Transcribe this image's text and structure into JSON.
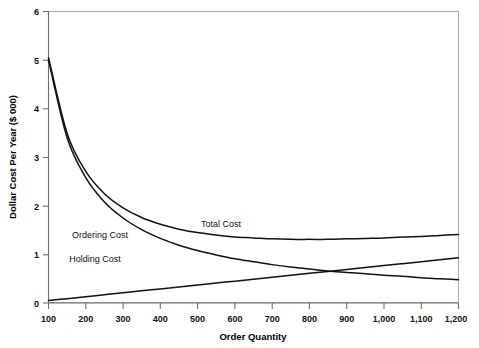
{
  "chart_data": {
    "type": "line",
    "title": "",
    "xlabel": "Order Quantity",
    "ylabel": "Dollar Cost Per Year ($ 000)",
    "xlim": [
      100,
      1200
    ],
    "ylim": [
      0,
      6
    ],
    "grid": false,
    "legend_position": "inline-annotations",
    "x_ticks": [
      100,
      200,
      300,
      400,
      500,
      600,
      700,
      800,
      900,
      1000,
      1100,
      1200
    ],
    "x_tick_labels": [
      "100",
      "200",
      "300",
      "400",
      "500",
      "600",
      "700",
      "800",
      "900",
      "1,000",
      "1,100",
      "1,200"
    ],
    "y_ticks": [
      0,
      1,
      2,
      3,
      4,
      5,
      6
    ],
    "y_tick_labels": [
      "0",
      "1",
      "2",
      "3",
      "4",
      "5",
      "6"
    ],
    "x": [
      100,
      150,
      200,
      250,
      300,
      350,
      400,
      450,
      500,
      550,
      600,
      650,
      700,
      750,
      800,
      850,
      900,
      950,
      1000,
      1050,
      1100,
      1150,
      1200
    ],
    "series": [
      {
        "name": "Ordering Cost",
        "label": "Ordering Cost",
        "color": "#111111",
        "values": [
          5.0,
          3.4,
          2.58,
          2.08,
          1.75,
          1.51,
          1.33,
          1.19,
          1.08,
          0.99,
          0.91,
          0.85,
          0.79,
          0.74,
          0.7,
          0.66,
          0.63,
          0.6,
          0.57,
          0.55,
          0.52,
          0.5,
          0.48
        ]
      },
      {
        "name": "Holding Cost",
        "label": "Holding Cost",
        "color": "#111111",
        "values": [
          0.05,
          0.09,
          0.13,
          0.17,
          0.21,
          0.25,
          0.29,
          0.33,
          0.37,
          0.41,
          0.45,
          0.49,
          0.53,
          0.57,
          0.61,
          0.65,
          0.69,
          0.73,
          0.77,
          0.81,
          0.85,
          0.89,
          0.93
        ]
      },
      {
        "name": "Total Cost",
        "label": "Total Cost",
        "color": "#111111",
        "values": [
          5.05,
          3.49,
          2.71,
          2.25,
          1.96,
          1.76,
          1.62,
          1.52,
          1.45,
          1.4,
          1.36,
          1.34,
          1.32,
          1.31,
          1.31,
          1.31,
          1.32,
          1.33,
          1.34,
          1.36,
          1.37,
          1.39,
          1.41
        ]
      }
    ],
    "annotations": [
      {
        "text": "Ordering Cost",
        "x": 100,
        "y": 238
      },
      {
        "text": "Total Cost",
        "x": 208,
        "y": 227
      },
      {
        "text": "Holding Cost",
        "x": 95,
        "y": 262
      }
    ],
    "crossover_point": {
      "x": 775,
      "y": 0.66
    }
  }
}
